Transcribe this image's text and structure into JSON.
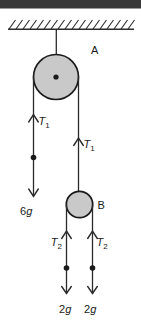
{
  "colors": {
    "background": "#ffffff",
    "top_bar": "#3a3a3a",
    "diagram_line": "#2b2b2b",
    "pulley_fill": "#c9c9c9",
    "pulley_stroke": "#1a1a1a",
    "text": "#1a1a1a"
  },
  "labels": {
    "pulley_a": "A",
    "pulley_b": "B",
    "t1": {
      "symbol": "T",
      "sub": "1"
    },
    "t2": {
      "symbol": "T",
      "sub": "2"
    },
    "mass_6g": {
      "coeff": "6",
      "unit": "g"
    },
    "mass_2g_left": {
      "coeff": "2",
      "unit": "g"
    },
    "mass_2g_right": {
      "coeff": "2",
      "unit": "g"
    }
  }
}
